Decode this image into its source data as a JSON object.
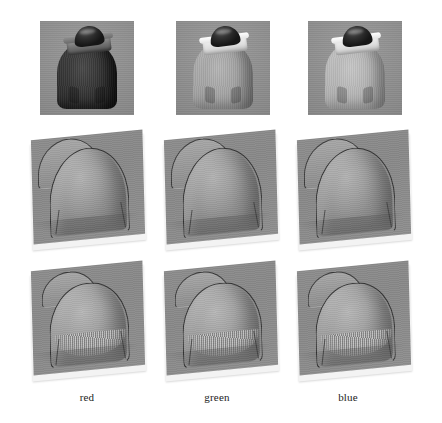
{
  "figure": {
    "background_color": "#ffffff",
    "columns": [
      {
        "key": "red",
        "label": "red"
      },
      {
        "key": "green",
        "label": "green"
      },
      {
        "key": "blue",
        "label": "blue"
      }
    ],
    "rows": [
      {
        "key": "input",
        "kind": "photograph",
        "caption": ""
      },
      {
        "key": "surface-smooth",
        "kind": "surface-plot",
        "caption": ""
      },
      {
        "key": "surface-detailed",
        "kind": "surface-plot",
        "caption": ""
      }
    ],
    "palette": {
      "plate_gray": "#8d8d8d",
      "photo_background_gray": "#8f8f8f",
      "outline_dark": "#343434",
      "page_white": "#ffffff",
      "label_text": "#1c1c1c"
    },
    "cells": {
      "row1": [
        {
          "id": "photo-red",
          "alt_name": "input-channel-red",
          "tone": "dark",
          "collar_tone": "dark"
        },
        {
          "id": "photo-green",
          "alt_name": "input-channel-green",
          "tone": "mid",
          "collar_tone": "bright"
        },
        {
          "id": "photo-blue",
          "alt_name": "input-channel-blue",
          "tone": "light",
          "collar_tone": "bright"
        }
      ],
      "row2": [
        {
          "id": "surface-red-smooth",
          "alt_name": "reconstructed-surface-red-smooth"
        },
        {
          "id": "surface-green-smooth",
          "alt_name": "reconstructed-surface-green-smooth"
        },
        {
          "id": "surface-blue-smooth",
          "alt_name": "reconstructed-surface-blue-smooth"
        }
      ],
      "row3": [
        {
          "id": "surface-red-detailed",
          "alt_name": "reconstructed-surface-red-detailed"
        },
        {
          "id": "surface-green-detailed",
          "alt_name": "reconstructed-surface-green-detailed"
        },
        {
          "id": "surface-blue-detailed",
          "alt_name": "reconstructed-surface-blue-detailed"
        }
      ]
    }
  }
}
